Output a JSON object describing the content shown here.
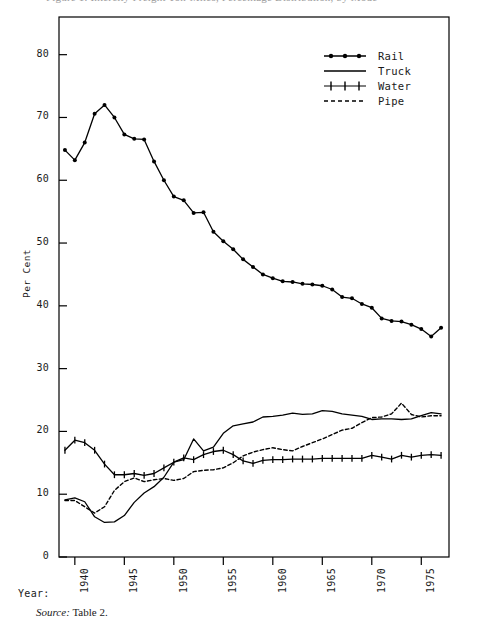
{
  "figure": {
    "title_cutoff": "Figure 1. Intercity Freight Ton-Miles, Percentage Distribution, by Mode",
    "year_caption": "Year:",
    "source_label": "Source:",
    "source_value": "Table 2."
  },
  "legend": {
    "position": "top-right",
    "entries": [
      {
        "key": "rail",
        "label": "Rail",
        "style": "line-with-dot-markers",
        "color": "#000000"
      },
      {
        "key": "truck",
        "label": "Truck",
        "style": "solid-line",
        "color": "#000000"
      },
      {
        "key": "water",
        "label": "Water",
        "style": "line-with-plus-markers",
        "color": "#000000"
      },
      {
        "key": "pipe",
        "label": "Pipe",
        "style": "dashed-line",
        "color": "#000000"
      }
    ]
  },
  "chart_data": {
    "type": "line",
    "title": "",
    "xlabel": "Year",
    "ylabel": "Per Cent",
    "xlim": [
      1938.4,
      1977.8
    ],
    "ylim": [
      0,
      86
    ],
    "grid": false,
    "legend_position": "top-right",
    "yticks": [
      0,
      10,
      20,
      30,
      40,
      50,
      60,
      70,
      80
    ],
    "xticks": [
      1940,
      1945,
      1950,
      1955,
      1960,
      1965,
      1970,
      1975
    ],
    "xtick_labels": [
      "1940",
      "1945",
      "1950",
      "1955",
      "1960",
      "1965",
      "1970",
      "1975"
    ],
    "x": [
      1939,
      1940,
      1941,
      1942,
      1943,
      1944,
      1945,
      1946,
      1947,
      1948,
      1949,
      1950,
      1951,
      1952,
      1953,
      1954,
      1955,
      1956,
      1957,
      1958,
      1959,
      1960,
      1961,
      1962,
      1963,
      1964,
      1965,
      1966,
      1967,
      1968,
      1969,
      1970,
      1971,
      1972,
      1973,
      1974,
      1975,
      1976,
      1977
    ],
    "series": [
      {
        "name": "Rail",
        "marker": "dot",
        "linestyle": "solid",
        "values": [
          64.8,
          63.2,
          66.0,
          70.6,
          72.0,
          70.0,
          67.3,
          66.6,
          66.5,
          63.0,
          60.0,
          57.4,
          56.8,
          54.8,
          54.9,
          51.8,
          50.3,
          49.0,
          47.4,
          46.2,
          45.0,
          44.4,
          43.9,
          43.8,
          43.5,
          43.4,
          43.2,
          42.6,
          41.4,
          41.2,
          40.3,
          39.7,
          38.0,
          37.6,
          37.5,
          37.0,
          36.3,
          35.1,
          36.5
        ]
      },
      {
        "name": "Truck",
        "marker": "none",
        "linestyle": "solid",
        "values": [
          9.1,
          9.4,
          8.8,
          6.4,
          5.5,
          5.6,
          6.6,
          8.7,
          10.2,
          11.2,
          12.7,
          15.1,
          15.5,
          18.8,
          16.9,
          17.5,
          19.7,
          20.9,
          21.2,
          21.5,
          22.3,
          22.4,
          22.6,
          22.9,
          22.7,
          22.8,
          23.3,
          23.2,
          22.8,
          22.6,
          22.4,
          21.9,
          22.0,
          22.0,
          21.9,
          22.0,
          22.5,
          23.0,
          22.8
        ]
      },
      {
        "name": "Water",
        "marker": "plus",
        "linestyle": "solid",
        "values": [
          17.0,
          18.6,
          18.2,
          17.0,
          14.8,
          13.1,
          13.1,
          13.3,
          13.0,
          13.3,
          14.2,
          15.1,
          15.8,
          15.5,
          16.3,
          16.8,
          17.0,
          16.3,
          15.3,
          14.9,
          15.4,
          15.5,
          15.5,
          15.6,
          15.6,
          15.6,
          15.7,
          15.7,
          15.7,
          15.7,
          15.7,
          16.2,
          15.9,
          15.6,
          16.2,
          15.9,
          16.2,
          16.3,
          16.2
        ]
      },
      {
        "name": "Pipe",
        "marker": "none",
        "linestyle": "dashed",
        "values": [
          9.0,
          9.0,
          8.0,
          7.0,
          8.0,
          10.6,
          12.0,
          12.6,
          12.0,
          12.3,
          12.5,
          12.2,
          12.5,
          13.6,
          13.8,
          13.9,
          14.2,
          15.0,
          16.1,
          16.7,
          17.1,
          17.4,
          17.1,
          16.9,
          17.6,
          18.2,
          18.8,
          19.5,
          20.2,
          20.5,
          21.4,
          22.2,
          22.3,
          22.8,
          24.5,
          22.7,
          22.3,
          22.5,
          22.5
        ]
      }
    ]
  }
}
